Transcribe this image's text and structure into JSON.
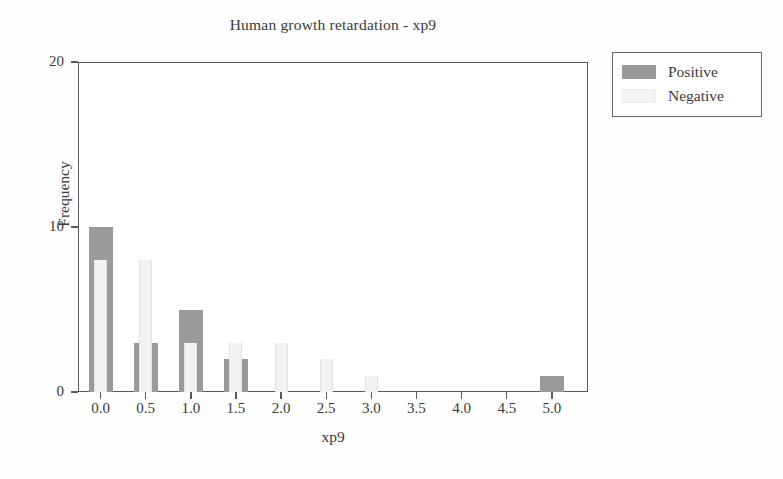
{
  "chart_data": {
    "type": "bar",
    "title": "Human growth retardation - xp9",
    "xlabel": "xp9",
    "ylabel": "Frequency",
    "xlim": [
      -0.25,
      5.4
    ],
    "ylim": [
      0,
      20
    ],
    "grid": false,
    "legend_position": "upper right (outside plot)",
    "xticks": [
      "0.0",
      "0.5",
      "1.0",
      "1.5",
      "2.0",
      "2.5",
      "3.0",
      "3.5",
      "4.0",
      "4.5",
      "5.0"
    ],
    "xtick_values": [
      0.0,
      0.5,
      1.0,
      1.5,
      2.0,
      2.5,
      3.0,
      3.5,
      4.0,
      4.5,
      5.0
    ],
    "yticks": [
      "0",
      "10",
      "20"
    ],
    "ytick_values": [
      0,
      10,
      20
    ],
    "categories": [
      "0.0",
      "0.5",
      "1.0",
      "1.5",
      "2.0",
      "2.5",
      "3.0",
      "3.5",
      "4.0",
      "4.5",
      "5.0"
    ],
    "x": [
      0.0,
      0.5,
      1.0,
      1.5,
      2.0,
      2.5,
      3.0,
      3.5,
      4.0,
      4.5,
      5.0
    ],
    "series": [
      {
        "name": "Positive",
        "color": "#9a9a9a",
        "values": [
          10,
          3,
          5,
          2,
          0,
          0,
          0,
          0,
          0,
          0,
          1
        ]
      },
      {
        "name": "Negative",
        "color": "#f2f2f2",
        "values": [
          8,
          8,
          3,
          3,
          3,
          2,
          1,
          0,
          0,
          0,
          0
        ]
      }
    ]
  },
  "legend": {
    "items": [
      {
        "label": "Positive",
        "swatch": "positive"
      },
      {
        "label": "Negative",
        "swatch": "negative"
      }
    ]
  }
}
